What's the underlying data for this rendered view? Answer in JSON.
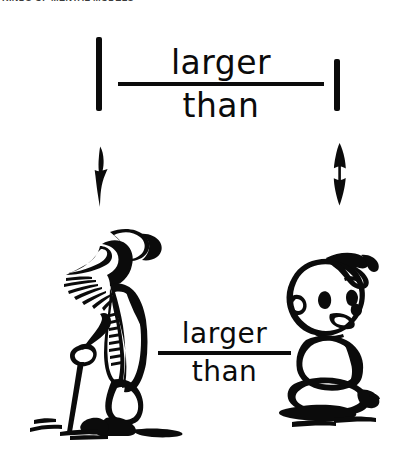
{
  "header": {
    "running_text": "KINDS OF MENTAL MODELS"
  },
  "diagram": {
    "ink_color": "#0b0b0b",
    "background_color": "#ffffff",
    "top_panel": {
      "left_bar_label": "tall vertical bar",
      "right_bar_label": "short vertical bar",
      "relation": {
        "numerator": "larger",
        "denominator": "than"
      },
      "left_arrow": "arrow-down",
      "right_arrow": "arrow-up-down"
    },
    "bottom_panel": {
      "left_figure": "old man with cane",
      "right_figure": "seated baby",
      "relation": {
        "numerator": "larger",
        "denominator": "than"
      }
    }
  }
}
